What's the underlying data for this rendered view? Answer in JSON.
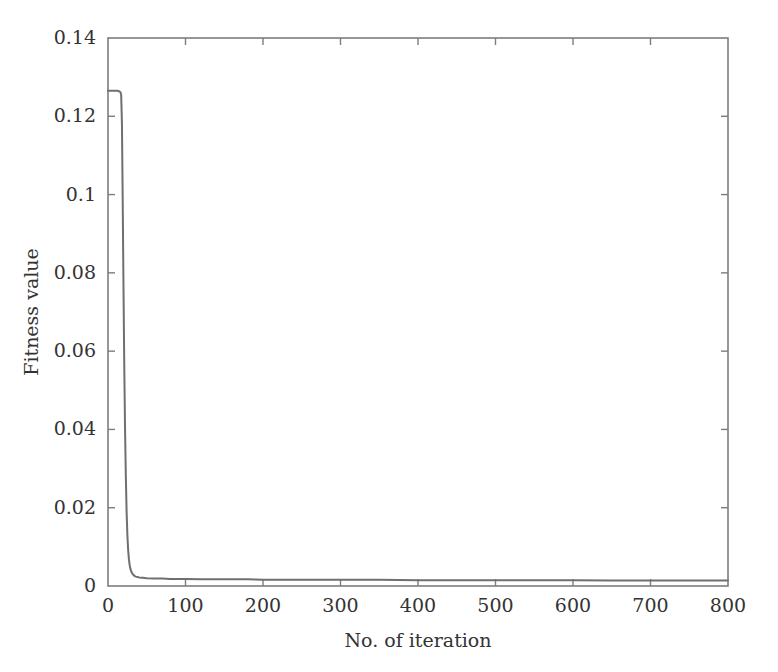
{
  "chart_data": {
    "type": "line",
    "title": "",
    "subtitle": "",
    "xlabel": "No. of iteration",
    "ylabel": "Fitness value",
    "xlim": [
      0,
      800
    ],
    "ylim": [
      0,
      0.14
    ],
    "xticks": [
      0,
      100,
      200,
      300,
      400,
      500,
      600,
      700,
      800
    ],
    "xtick_labels": [
      "0",
      "100",
      "200",
      "300",
      "400",
      "500",
      "600",
      "700",
      "800"
    ],
    "yticks": [
      0,
      0.02,
      0.04,
      0.06,
      0.08,
      0.1,
      0.12,
      0.14
    ],
    "ytick_labels": [
      "0",
      "0.02",
      "0.04",
      "0.06",
      "0.08",
      "0.1",
      "0.12",
      "0.14"
    ],
    "grid": false,
    "legend": null,
    "line_color": "#6f6f6f",
    "axis_color": "#7d7d7d",
    "background_color": "#ffffff",
    "series": [
      {
        "name": "Fitness value",
        "x": [
          0,
          2,
          4,
          6,
          8,
          10,
          12,
          14,
          16,
          17,
          18,
          19,
          20,
          21,
          22,
          23,
          24,
          25,
          26,
          27,
          28,
          29,
          30,
          32,
          34,
          36,
          38,
          40,
          45,
          50,
          60,
          70,
          80,
          90,
          100,
          120,
          140,
          160,
          180,
          200,
          250,
          300,
          350,
          400,
          450,
          500,
          550,
          600,
          650,
          700,
          750,
          800
        ],
        "y": [
          0.1265,
          0.1265,
          0.1265,
          0.1265,
          0.1265,
          0.1265,
          0.1265,
          0.1264,
          0.1262,
          0.1255,
          0.118,
          0.098,
          0.076,
          0.056,
          0.04,
          0.028,
          0.019,
          0.013,
          0.0092,
          0.0068,
          0.0053,
          0.0043,
          0.0037,
          0.003,
          0.0026,
          0.0024,
          0.0023,
          0.0022,
          0.0021,
          0.002,
          0.0019,
          0.0019,
          0.0018,
          0.0018,
          0.0018,
          0.0017,
          0.0017,
          0.0017,
          0.0017,
          0.0016,
          0.0016,
          0.0016,
          0.0016,
          0.0015,
          0.0015,
          0.0015,
          0.0015,
          0.0015,
          0.0014,
          0.0014,
          0.0014,
          0.0014
        ]
      }
    ]
  }
}
